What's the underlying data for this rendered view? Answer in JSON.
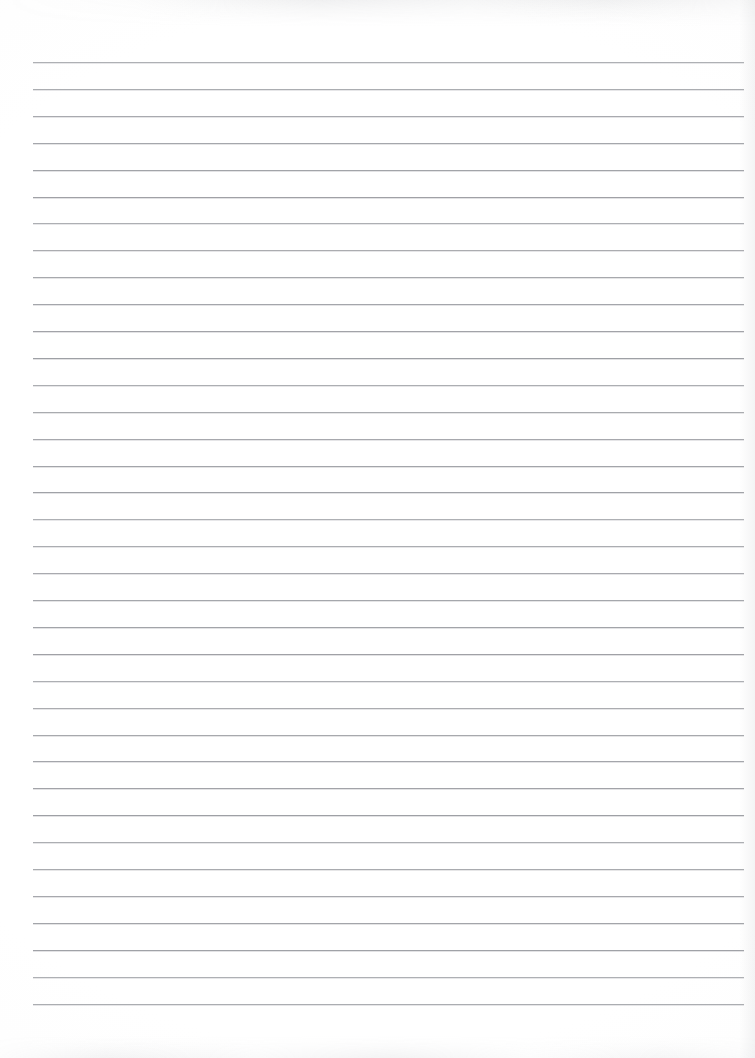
{
  "document": {
    "kind": "scanned-lined-paper",
    "title": "",
    "visible_text": "",
    "page_background_color": "#ffffff",
    "rule_color": "#9b9da2",
    "artifact_color": "#96989e"
  },
  "page": {
    "width": 755,
    "height": 1058
  },
  "ruling": {
    "line_count": 36,
    "first_line_y": 62,
    "line_spacing": 26.9,
    "line_left_x": 33,
    "line_right_x": 744,
    "line_length": 711,
    "line_thickness": 1,
    "orientation": "horizontal",
    "margin_rule_present": false,
    "holes_present": false,
    "line_positions_y": [
      62,
      88.9,
      115.8,
      142.7,
      169.6,
      196.5,
      223.4,
      250.3,
      277.2,
      304.1,
      331,
      357.9,
      384.8,
      411.7,
      438.6,
      465.5,
      492.4,
      519.3,
      546.2,
      573.1,
      600,
      626.9,
      653.8,
      680.7,
      707.6,
      734.5,
      761.4,
      788.3,
      815.2,
      842.1,
      869,
      895.9,
      922.8,
      949.7,
      976.6,
      1003.5
    ]
  },
  "artifacts": {
    "top_edge_smudge": true,
    "bottom_edge_smudge": true,
    "right_edge_shading": true
  },
  "content": {
    "written_lines": [
      "",
      "",
      "",
      "",
      "",
      "",
      "",
      "",
      "",
      "",
      "",
      "",
      "",
      "",
      "",
      "",
      "",
      "",
      "",
      "",
      "",
      "",
      "",
      "",
      "",
      "",
      "",
      "",
      "",
      "",
      "",
      "",
      "",
      "",
      "",
      ""
    ]
  }
}
